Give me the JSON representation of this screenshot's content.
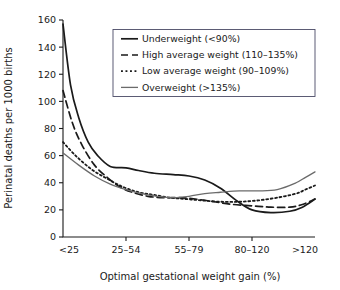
{
  "chart_data": {
    "type": "line",
    "title": "",
    "xlabel": "Optimal gestational weight gain (%)",
    "ylabel": "Perinatal deaths per 1000 births",
    "categories": [
      "<25",
      "25–54",
      "55–79",
      "80–120",
      ">120"
    ],
    "xtick_labels": [
      "<25",
      "25–54",
      "55–79",
      "80–120",
      ">120"
    ],
    "ytick_labels": [
      "0",
      "20",
      "40",
      "60",
      "80",
      "100",
      "120",
      "140",
      "160"
    ],
    "ytick_values": [
      0,
      20,
      40,
      60,
      80,
      100,
      120,
      140,
      160
    ],
    "ylim": [
      0,
      160
    ],
    "grid": false,
    "legend_position": "top-right",
    "series": [
      {
        "name": "Underweight (<90%)",
        "style": "solid",
        "color": "#1a1a1a",
        "width": 1.7,
        "values": [
          157,
          51,
          46,
          19,
          28
        ],
        "points": [
          [
            0,
            157
          ],
          [
            0.12,
            112
          ],
          [
            0.25,
            88
          ],
          [
            0.4,
            70
          ],
          [
            0.55,
            60
          ],
          [
            0.75,
            52
          ],
          [
            1.0,
            51
          ],
          [
            1.2,
            49
          ],
          [
            1.45,
            47
          ],
          [
            1.75,
            46
          ],
          [
            2.0,
            45
          ],
          [
            2.25,
            42
          ],
          [
            2.5,
            36
          ],
          [
            2.75,
            27
          ],
          [
            3.0,
            20
          ],
          [
            3.3,
            18
          ],
          [
            3.6,
            19
          ],
          [
            3.8,
            22
          ],
          [
            4.0,
            28
          ]
        ]
      },
      {
        "name": "High average weight (110–135%)",
        "style": "dashed",
        "color": "#1a1a1a",
        "width": 1.7,
        "values": [
          108,
          32,
          27,
          22,
          28
        ],
        "points": [
          [
            0,
            108
          ],
          [
            0.15,
            84
          ],
          [
            0.3,
            68
          ],
          [
            0.5,
            53
          ],
          [
            0.7,
            44
          ],
          [
            0.9,
            37
          ],
          [
            1.1,
            33
          ],
          [
            1.35,
            30
          ],
          [
            1.6,
            29
          ],
          [
            1.85,
            29
          ],
          [
            2.1,
            28
          ],
          [
            2.4,
            26
          ],
          [
            2.7,
            24
          ],
          [
            3.0,
            23
          ],
          [
            3.3,
            22
          ],
          [
            3.6,
            22
          ],
          [
            3.8,
            24
          ],
          [
            4.0,
            28
          ]
        ]
      },
      {
        "name": "Low average weight (90–109%)",
        "style": "dotted",
        "color": "#1a1a1a",
        "width": 1.8,
        "values": [
          70,
          34,
          28,
          27,
          38
        ],
        "points": [
          [
            0,
            70
          ],
          [
            0.2,
            60
          ],
          [
            0.45,
            50
          ],
          [
            0.7,
            43
          ],
          [
            0.95,
            37
          ],
          [
            1.2,
            33
          ],
          [
            1.45,
            31
          ],
          [
            1.7,
            29
          ],
          [
            1.95,
            28
          ],
          [
            2.2,
            27
          ],
          [
            2.5,
            26
          ],
          [
            2.8,
            26
          ],
          [
            3.1,
            27
          ],
          [
            3.4,
            29
          ],
          [
            3.7,
            32
          ],
          [
            3.85,
            35
          ],
          [
            4.0,
            38
          ]
        ]
      },
      {
        "name": "Overweight (>135%)",
        "style": "solid",
        "color": "#6b6b6b",
        "width": 1.3,
        "values": [
          62,
          30,
          33,
          34,
          48
        ],
        "points": [
          [
            0,
            62
          ],
          [
            0.25,
            53
          ],
          [
            0.5,
            45
          ],
          [
            0.75,
            39
          ],
          [
            1.0,
            35
          ],
          [
            1.25,
            32
          ],
          [
            1.5,
            30
          ],
          [
            1.75,
            29
          ],
          [
            2.0,
            30
          ],
          [
            2.25,
            32
          ],
          [
            2.5,
            33
          ],
          [
            2.8,
            34
          ],
          [
            3.1,
            34
          ],
          [
            3.4,
            35
          ],
          [
            3.7,
            40
          ],
          [
            3.85,
            44
          ],
          [
            4.0,
            48
          ]
        ]
      }
    ]
  },
  "legend": {
    "items": [
      {
        "label": "Underweight (<90%)"
      },
      {
        "label": "High average weight (110–135%)"
      },
      {
        "label": "Low average weight (90–109%)"
      },
      {
        "label": "Overweight (>135%)"
      }
    ]
  }
}
